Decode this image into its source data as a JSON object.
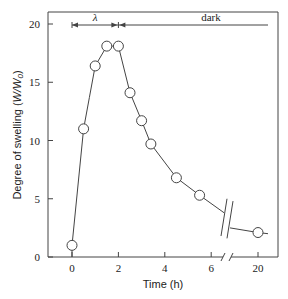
{
  "chart_data": {
    "type": "line",
    "title": "",
    "xlabel": "Time (h)",
    "ylabel": "Degree of swelling (W/W0)",
    "ylabel_parts": {
      "prefix": "Degree of swelling (",
      "var": "W/W",
      "sub": "0",
      "suffix": ")"
    },
    "x_ticks": [
      "0",
      "2",
      "4",
      "6",
      "20"
    ],
    "y_ticks": [
      "0",
      "5",
      "10",
      "15",
      "20"
    ],
    "ylim": [
      0,
      20
    ],
    "x_axis_break": "between 6 and 20",
    "grid": false,
    "legend": null,
    "marker": "open-circle",
    "annotations": [
      {
        "label": "λ",
        "span": [
          0,
          2
        ],
        "meaning": "light period"
      },
      {
        "label": "dark",
        "span": [
          2,
          20
        ],
        "meaning": "dark period"
      }
    ],
    "series": [
      {
        "name": "Degree of swelling",
        "x": [
          0,
          0.5,
          1.0,
          1.5,
          2.0,
          2.5,
          3.0,
          3.4,
          4.5,
          5.5,
          20
        ],
        "values": [
          1.0,
          11.0,
          16.4,
          18.1,
          18.1,
          14.1,
          11.7,
          9.7,
          6.8,
          5.3,
          2.1
        ]
      }
    ]
  }
}
